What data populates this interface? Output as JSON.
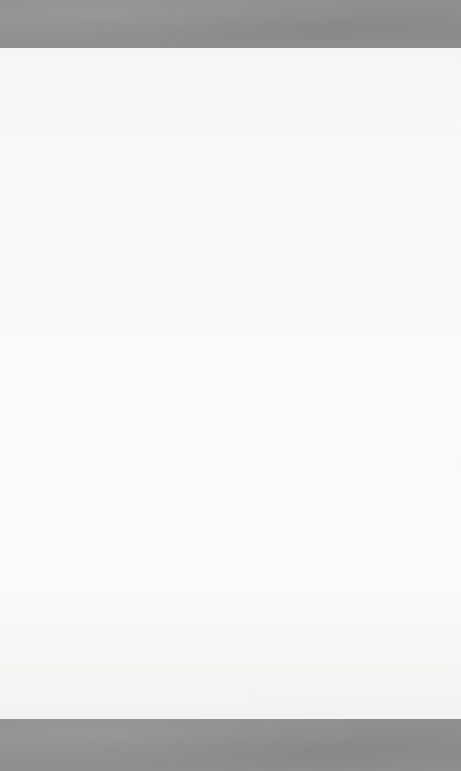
{
  "page": {
    "type": "lined-stationery",
    "background_color": "#fbfbfb",
    "band_color": "#8f8f8f",
    "tree_color": "#bdbdbd",
    "rule_color": "#7d7d7d"
  },
  "top_border": {
    "icon": "christmas-tree-icon",
    "tree_centers_x": [
      60,
      128,
      197,
      265,
      333,
      402
    ],
    "partial_tree_centers_x": [
      26,
      95,
      163,
      231,
      300,
      368,
      434
    ]
  },
  "bottom_border": {
    "icon": "christmas-tree-icon",
    "tree_centers_x": [
      27,
      96,
      164,
      232,
      300,
      368,
      435
    ],
    "partial_tree_centers_x": [
      62,
      130,
      198,
      266,
      334,
      402
    ]
  },
  "lines": {
    "count": 26,
    "first_y": 93,
    "spacing": 24.12,
    "x_start": 50,
    "x_end": 434
  }
}
